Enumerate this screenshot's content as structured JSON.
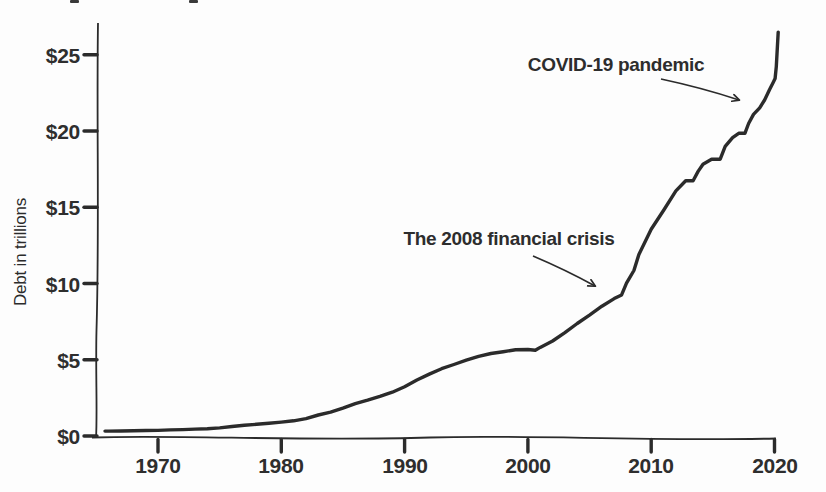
{
  "page": {
    "background_color": "#fdfdfd",
    "ink_color": "#2b2b2b",
    "style": "hand-drawn scanned book chart"
  },
  "chart_data": {
    "type": "line",
    "title": "",
    "xlabel": "",
    "ylabel": "Debt in trillions",
    "xlim": [
      1965,
      2020.6
    ],
    "ylim": [
      0,
      26.6
    ],
    "grid": false,
    "legend": "none",
    "x_ticks": [
      {
        "value": 1970,
        "label": "1970"
      },
      {
        "value": 1980,
        "label": "1980"
      },
      {
        "value": 1990,
        "label": "1990"
      },
      {
        "value": 2000,
        "label": "2000"
      },
      {
        "value": 2010,
        "label": "2010"
      },
      {
        "value": 2020,
        "label": "2020"
      }
    ],
    "y_ticks": [
      {
        "value": 0,
        "label": "$0"
      },
      {
        "value": 5,
        "label": "$5"
      },
      {
        "value": 10,
        "label": "$10"
      },
      {
        "value": 15,
        "label": "$15"
      },
      {
        "value": 20,
        "label": "$20"
      },
      {
        "value": 25,
        "label": "$25"
      }
    ],
    "series": [
      {
        "name": "US national debt, trillions of dollars",
        "points": [
          [
            1965.7,
            0.32
          ],
          [
            1966,
            0.32
          ],
          [
            1967,
            0.33
          ],
          [
            1968,
            0.35
          ],
          [
            1969,
            0.36
          ],
          [
            1970,
            0.37
          ],
          [
            1971,
            0.4
          ],
          [
            1972,
            0.42
          ],
          [
            1973,
            0.45
          ],
          [
            1974,
            0.47
          ],
          [
            1975,
            0.53
          ],
          [
            1976,
            0.62
          ],
          [
            1977,
            0.7
          ],
          [
            1978,
            0.77
          ],
          [
            1979,
            0.83
          ],
          [
            1980,
            0.91
          ],
          [
            1981,
            1.0
          ],
          [
            1982,
            1.14
          ],
          [
            1983,
            1.38
          ],
          [
            1984,
            1.56
          ],
          [
            1985,
            1.82
          ],
          [
            1986,
            2.12
          ],
          [
            1987,
            2.35
          ],
          [
            1988,
            2.6
          ],
          [
            1989,
            2.87
          ],
          [
            1990,
            3.23
          ],
          [
            1991,
            3.67
          ],
          [
            1992,
            4.06
          ],
          [
            1993,
            4.41
          ],
          [
            1994,
            4.69
          ],
          [
            1995,
            4.97
          ],
          [
            1996,
            5.22
          ],
          [
            1997,
            5.41
          ],
          [
            1998,
            5.53
          ],
          [
            1999,
            5.66
          ],
          [
            2000,
            5.67
          ],
          [
            2000.6,
            5.62
          ],
          [
            2001,
            5.81
          ],
          [
            2002,
            6.23
          ],
          [
            2003,
            6.78
          ],
          [
            2004,
            7.38
          ],
          [
            2005,
            7.93
          ],
          [
            2006,
            8.51
          ],
          [
            2007,
            9.01
          ],
          [
            2007.6,
            9.25
          ],
          [
            2008,
            10.02
          ],
          [
            2008.6,
            10.85
          ],
          [
            2009,
            11.91
          ],
          [
            2010,
            13.56
          ],
          [
            2011,
            14.79
          ],
          [
            2012,
            16.07
          ],
          [
            2012.8,
            16.74
          ],
          [
            2013.4,
            16.74
          ],
          [
            2013.8,
            17.35
          ],
          [
            2014.2,
            17.82
          ],
          [
            2014.9,
            18.15
          ],
          [
            2015.6,
            18.15
          ],
          [
            2016,
            19.0
          ],
          [
            2016.6,
            19.57
          ],
          [
            2017.1,
            19.85
          ],
          [
            2017.6,
            19.85
          ],
          [
            2017.9,
            20.49
          ],
          [
            2018.3,
            21.09
          ],
          [
            2018.8,
            21.52
          ],
          [
            2019.2,
            22.03
          ],
          [
            2019.6,
            22.72
          ],
          [
            2019.9,
            23.2
          ],
          [
            2020.05,
            23.44
          ],
          [
            2020.15,
            24.22
          ],
          [
            2020.3,
            26.48
          ]
        ]
      }
    ],
    "annotations": [
      {
        "label": "The 2008 financial crisis",
        "target_year": 2006.4,
        "target_value": 9.7
      },
      {
        "label": "COVID-19 pandemic",
        "target_year": 2017.7,
        "target_value": 22.0
      }
    ]
  }
}
